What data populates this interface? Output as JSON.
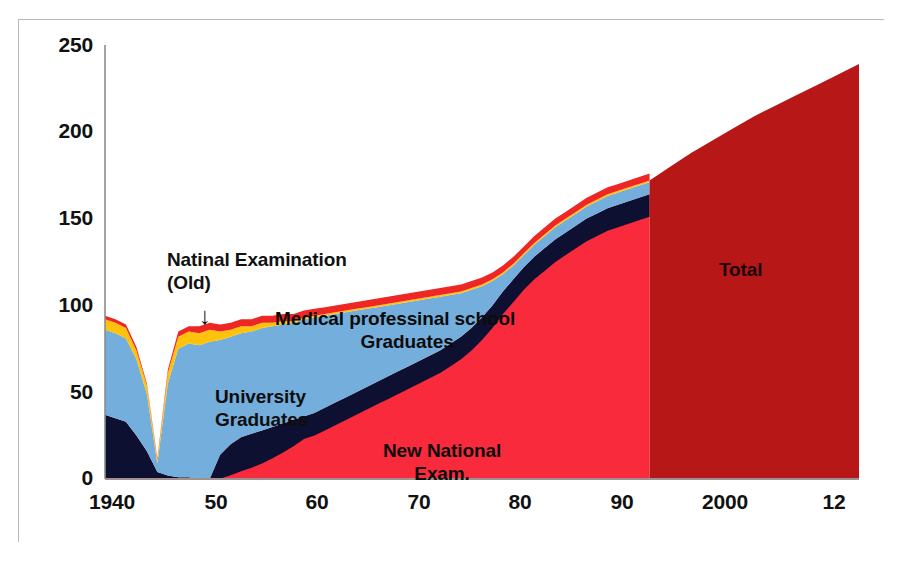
{
  "figure": {
    "background": "#ffffff",
    "frame_color": "#b8b8b8"
  },
  "annotations": {
    "national_old_line1": "Natinal Examination",
    "national_old_line2": "(Old)",
    "arrow_glyph": "↓",
    "medschool_line1": "Medical professinal school",
    "medschool_line2": "Graduates",
    "university_line1": "University",
    "university_line2": "Graduates",
    "newnational_line1": "New National",
    "newnational_line2": "Exam.",
    "total_label": "Total"
  },
  "chart_data": {
    "type": "area",
    "title": "",
    "xlabel": "",
    "ylabel": "",
    "xlim": [
      1940,
      2012
    ],
    "ylim": [
      0,
      250
    ],
    "grid": false,
    "legend_position": "in-plot annotations",
    "xticks": [
      1940,
      1950,
      1960,
      1970,
      1980,
      1990,
      2000,
      2012
    ],
    "xtick_labels": [
      "1940",
      "50",
      "60",
      "70",
      "80",
      "90",
      "2000",
      "12"
    ],
    "yticks": [
      0,
      50,
      100,
      150,
      200,
      250
    ],
    "ytick_labels": [
      "0",
      "50",
      "100",
      "150",
      "200",
      "250"
    ],
    "colors": {
      "university_graduates": "#0d1030",
      "medical_professional_school_graduates": "#74aedc",
      "band_yellow": "#fdc209",
      "band_red_top": "#ee2724",
      "new_national_exam": "#f82a3b",
      "total": "#b81717"
    },
    "series": [
      {
        "name": "University Graduates",
        "color": "#0d1030",
        "stack_order": 1,
        "x": [
          1940,
          1941,
          1942,
          1943,
          1944,
          1945,
          1946,
          1947,
          1948,
          1949,
          1950,
          1951,
          1952,
          1953,
          1954,
          1955,
          1956,
          1957,
          1958,
          1959,
          1960,
          1961,
          1962,
          1963,
          1964,
          1965,
          1966,
          1967,
          1968,
          1969,
          1970,
          1971,
          1972,
          1973,
          1974,
          1975,
          1976,
          1977,
          1978,
          1979,
          1980,
          1981,
          1982,
          1983,
          1984,
          1985,
          1986,
          1987,
          1988,
          1989,
          1990,
          1991,
          1992
        ],
        "values": [
          37,
          35,
          33,
          25,
          16,
          4,
          2,
          1,
          1,
          0,
          0,
          14,
          20,
          24,
          26,
          28,
          30,
          32,
          34,
          36,
          38,
          41,
          44,
          47,
          50,
          53,
          56,
          59,
          62,
          65,
          68,
          71,
          74,
          78,
          82,
          87,
          93,
          100,
          108,
          115,
          122,
          128,
          133,
          138,
          142,
          146,
          150,
          153,
          156,
          158,
          160,
          162,
          164
        ]
      },
      {
        "name": "Medical professinal school Graduates",
        "color": "#74aedc",
        "stack_order": 2,
        "x": [
          1940,
          1941,
          1942,
          1943,
          1944,
          1945,
          1946,
          1947,
          1948,
          1949,
          1950,
          1951,
          1952,
          1953,
          1954,
          1955,
          1956,
          1957,
          1958,
          1959,
          1960,
          1961,
          1962,
          1963,
          1964,
          1965,
          1966,
          1967,
          1968,
          1969,
          1970,
          1971,
          1972,
          1973,
          1974,
          1975,
          1976,
          1977,
          1978,
          1979,
          1980,
          1981,
          1982,
          1983,
          1984,
          1985,
          1986,
          1987,
          1988,
          1989,
          1990,
          1991,
          1992
        ],
        "values": [
          49,
          49,
          48,
          44,
          33,
          5,
          53,
          74,
          77,
          77,
          79,
          66,
          62,
          60,
          59,
          59,
          58,
          57,
          56,
          56,
          55,
          53,
          51,
          49,
          47,
          45,
          43,
          41,
          39,
          37,
          35,
          33,
          31,
          28,
          25,
          22,
          18,
          14,
          10,
          8,
          7,
          7,
          7,
          7,
          7,
          7,
          7,
          7,
          7,
          7,
          7,
          7,
          7
        ]
      },
      {
        "name": "Yellow band",
        "color": "#fdc209",
        "stack_order": 3,
        "x": [
          1940,
          1941,
          1942,
          1943,
          1944,
          1945,
          1946,
          1947,
          1948,
          1949,
          1950,
          1951,
          1952,
          1953,
          1954,
          1955,
          1956,
          1957,
          1958,
          1959,
          1960,
          1961,
          1962,
          1963,
          1964,
          1965,
          1966,
          1967,
          1968,
          1969,
          1970,
          1971,
          1972,
          1973,
          1974,
          1975,
          1976,
          1977,
          1978,
          1979,
          1980,
          1981,
          1982,
          1983,
          1984,
          1985,
          1986,
          1987,
          1988,
          1989,
          1990,
          1991,
          1992
        ],
        "values": [
          6,
          6,
          6,
          5,
          5,
          2,
          6,
          7,
          7,
          7,
          7,
          5,
          4,
          4,
          3,
          3,
          2,
          2,
          1,
          1,
          1,
          1,
          1,
          1,
          1,
          1,
          1,
          1,
          1,
          1,
          1,
          1,
          1,
          1,
          1,
          1,
          1,
          1,
          1,
          1,
          1,
          1,
          1,
          1,
          1,
          1,
          1,
          1,
          1,
          1,
          1,
          1,
          1
        ]
      },
      {
        "name": "Red top band",
        "color": "#ee2724",
        "stack_order": 4,
        "x": [
          1940,
          1941,
          1942,
          1943,
          1944,
          1945,
          1946,
          1947,
          1948,
          1949,
          1950,
          1951,
          1952,
          1953,
          1954,
          1955,
          1956,
          1957,
          1958,
          1959,
          1960,
          1961,
          1962,
          1963,
          1964,
          1965,
          1966,
          1967,
          1968,
          1969,
          1970,
          1971,
          1972,
          1973,
          1974,
          1975,
          1976,
          1977,
          1978,
          1979,
          1980,
          1981,
          1982,
          1983,
          1984,
          1985,
          1986,
          1987,
          1988,
          1989,
          1990,
          1991,
          1992
        ],
        "values": [
          2,
          2,
          2,
          2,
          1,
          1,
          2,
          3,
          3,
          4,
          4,
          4,
          4,
          4,
          4,
          4,
          4,
          4,
          4,
          4,
          4,
          4,
          4,
          4,
          4,
          4,
          4,
          4,
          4,
          4,
          4,
          4,
          4,
          4,
          4,
          4,
          4,
          4,
          4,
          4,
          4,
          4,
          4,
          4,
          4,
          4,
          4,
          4,
          4,
          4,
          4,
          4,
          4
        ]
      },
      {
        "name": "New National Exam.",
        "color": "#f82a3b",
        "note": "bright red region beneath the university-graduates band, 1949-1992",
        "x": [
          1949,
          1950,
          1951,
          1952,
          1953,
          1954,
          1955,
          1956,
          1957,
          1958,
          1959,
          1960,
          1961,
          1962,
          1963,
          1964,
          1965,
          1966,
          1967,
          1968,
          1969,
          1970,
          1971,
          1972,
          1973,
          1974,
          1975,
          1976,
          1977,
          1978,
          1979,
          1980,
          1981,
          1982,
          1983,
          1984,
          1985,
          1986,
          1987,
          1988,
          1989,
          1990,
          1991,
          1992
        ],
        "values": [
          0,
          0,
          14,
          20,
          24,
          26,
          28,
          30,
          32,
          34,
          36,
          38,
          41,
          44,
          47,
          50,
          53,
          56,
          59,
          62,
          65,
          68,
          71,
          74,
          78,
          82,
          87,
          93,
          100,
          108,
          115,
          122,
          128,
          133,
          138,
          142,
          146,
          150,
          153,
          156,
          158,
          160,
          162,
          164
        ]
      },
      {
        "name": "Total",
        "color": "#b81717",
        "note": "dark red total region from 1992 to 2012",
        "x": [
          1992,
          1994,
          1996,
          1998,
          2000,
          2002,
          2004,
          2006,
          2008,
          2010,
          2012
        ],
        "values": [
          172,
          180,
          188,
          195,
          202,
          209,
          215,
          221,
          227,
          233,
          239
        ]
      }
    ]
  }
}
